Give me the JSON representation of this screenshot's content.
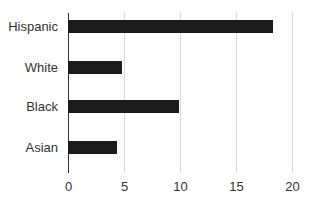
{
  "chart_data": {
    "type": "bar",
    "orientation": "horizontal",
    "title": "",
    "xlabel": "",
    "ylabel": "",
    "categories": [
      "Hispanic",
      "White",
      "Black",
      "Asian"
    ],
    "values": [
      18.3,
      4.8,
      9.9,
      4.4
    ],
    "xlim": [
      0,
      20
    ],
    "xticks": [
      0,
      5,
      10,
      15,
      20
    ],
    "grid": true,
    "bar_color": "#1c1c1c",
    "legend": null
  }
}
